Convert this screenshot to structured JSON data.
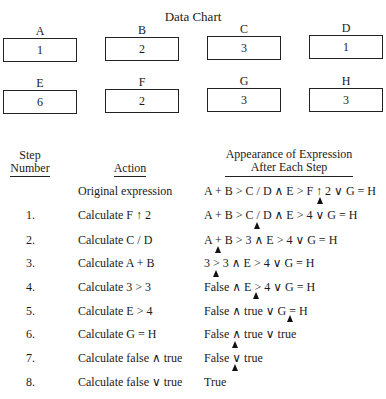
{
  "title": "Data Chart",
  "cells": [
    {
      "label": "A",
      "value": "1"
    },
    {
      "label": "B",
      "value": "2"
    },
    {
      "label": "C",
      "value": "3"
    },
    {
      "label": "D",
      "value": "1"
    },
    {
      "label": "E",
      "value": "6"
    },
    {
      "label": "F",
      "value": "2"
    },
    {
      "label": "G",
      "value": "3"
    },
    {
      "label": "H",
      "value": "3"
    }
  ],
  "headers": {
    "step_line1": "Step",
    "step_line2": "Number",
    "action": "Action",
    "expr_line1": "Appearance of Expression",
    "expr_line2": "After Each Step"
  },
  "rows": [
    {
      "num": "",
      "action": "Original expression",
      "expr": "A + B > C / D ∧ E > F ↑ 2 ∨ G = H"
    },
    {
      "num": "1.",
      "action": "Calculate F ↑ 2",
      "expr": "A + B > C / D ∧ E > 4 ∨ G = H"
    },
    {
      "num": "2.",
      "action": "Calculate C / D",
      "expr": "A + B > 3 ∧ E > 4 ∨ G = H"
    },
    {
      "num": "3.",
      "action": "Calculate A + B",
      "expr": "3 > 3 ∧ E > 4 ∨ G = H"
    },
    {
      "num": "4.",
      "action": "Calculate 3 > 3",
      "expr": "False ∧ E > 4 ∨ G = H"
    },
    {
      "num": "5.",
      "action": "Calculate E > 4",
      "expr": "False ∧ true ∨ G = H"
    },
    {
      "num": "6.",
      "action": "Calculate G = H",
      "expr": "False ∧ true ∨ true"
    },
    {
      "num": "7.",
      "action": "Calculate false ∧ true",
      "expr": "False ∨ true"
    },
    {
      "num": "8.",
      "action": "Calculate false ∨ true",
      "expr": "True"
    }
  ]
}
